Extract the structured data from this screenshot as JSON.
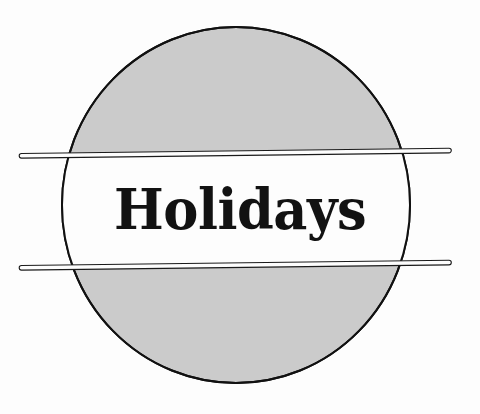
{
  "artwork": {
    "kind": "logo-emblem",
    "title": "Holidays",
    "background_color": "#fdfdfd",
    "circle": {
      "name": "gray-circle",
      "fill_color": "#cbcbcb",
      "stroke_color": "#111111",
      "center_x": 236,
      "center_y": 205,
      "radius_x": 174,
      "radius_y": 178
    },
    "white_band": {
      "name": "white-band",
      "fill_color": "#fdfdfd",
      "top_y": 150,
      "bottom_y": 264
    },
    "rules": [
      {
        "name": "upper-rule",
        "label": "upper horizontal rule",
        "left_x": 18,
        "right_x": 452,
        "left_y": 152,
        "right_y": 147,
        "thickness": 5,
        "stroke_color": "#1a1a1a"
      },
      {
        "name": "lower-rule",
        "label": "lower horizontal rule",
        "left_x": 18,
        "right_x": 452,
        "left_y": 267,
        "right_y": 262,
        "thickness": 5,
        "stroke_color": "#1a1a1a"
      }
    ]
  }
}
